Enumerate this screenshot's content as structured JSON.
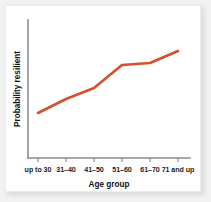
{
  "chart_data": {
    "type": "line",
    "title": "",
    "xlabel": "Age group",
    "ylabel": "Probability resilient",
    "categories": [
      "up to 30",
      "31–40",
      "41–50",
      "51–60",
      "61–70",
      "71 and up"
    ],
    "series": [
      {
        "name": "Probability resilient",
        "color": "#d2502a",
        "values": [
          0.3,
          0.44,
          0.55,
          0.78,
          0.8,
          0.91
        ]
      }
    ],
    "xlim": [
      0,
      5
    ],
    "ylim": [
      0,
      1
    ],
    "grid": false,
    "legend": null,
    "y_tick_labels": [],
    "x_tick_labels": [
      "up to 30",
      "31–40",
      "41–50",
      "51–60",
      "61–70",
      "71 and up"
    ],
    "annotations": [],
    "points_px": [
      {
        "x": 38,
        "y": 113
      },
      {
        "x": 66,
        "y": 99
      },
      {
        "x": 94,
        "y": 88
      },
      {
        "x": 122,
        "y": 65
      },
      {
        "x": 150,
        "y": 63
      },
      {
        "x": 178,
        "y": 51
      }
    ],
    "axis": {
      "x_axis_y_px": 158,
      "y_axis_x_px": 28,
      "y_axis_top_px": 20,
      "x_axis_right_px": 190,
      "tick_x_px": [
        38,
        66,
        94,
        122,
        150,
        178
      ],
      "axis_color": "#8a8d8f"
    }
  },
  "figure": {
    "background_color": "#ffffff",
    "page_background_color": "#f2f2f2",
    "border_color": "#ededed"
  }
}
